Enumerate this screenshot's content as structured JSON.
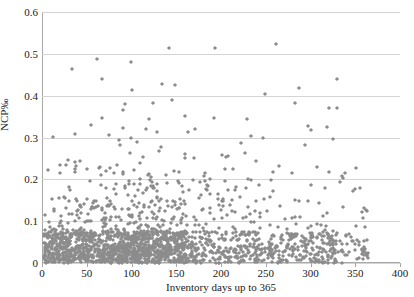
{
  "figure": {
    "cut_off_title": "",
    "background": "#ffffff",
    "marker_color": "#8c8c8c",
    "gridline_color": "#d4d4d4",
    "axis_color": "#a8a8a8"
  },
  "chart_data": {
    "type": "scatter",
    "title": "",
    "xlabel": "Inventory days up to 365",
    "ylabel": "NCP‰",
    "xlim": [
      0,
      400
    ],
    "ylim": [
      0,
      0.6
    ],
    "xticks": [
      0,
      50,
      100,
      150,
      200,
      250,
      300,
      350,
      400
    ],
    "xtick_labels": [
      "0",
      "50",
      "100",
      "150",
      "200",
      "250",
      "300",
      "350",
      "400"
    ],
    "yticks": [
      0,
      0.1,
      0.2,
      0.3,
      0.4,
      0.5,
      0.6
    ],
    "ytick_labels": [
      "0",
      "0.1",
      "0.2",
      "0.3",
      "0.4",
      "0.5",
      "0.6"
    ],
    "grid": "horizontal",
    "legend": "none",
    "marker": "diamond",
    "series_name": "observations",
    "n_points": 1600,
    "notable_points": [
      {
        "x": 193,
        "y": 0.515
      },
      {
        "x": 99,
        "y": 0.481
      },
      {
        "x": 33,
        "y": 0.463
      },
      {
        "x": 330,
        "y": 0.441
      },
      {
        "x": 134,
        "y": 0.429
      },
      {
        "x": 287,
        "y": 0.419
      },
      {
        "x": 330,
        "y": 0.37
      },
      {
        "x": 93,
        "y": 0.38
      },
      {
        "x": 91,
        "y": 0.366
      },
      {
        "x": 119,
        "y": 0.345
      },
      {
        "x": 55,
        "y": 0.331
      },
      {
        "x": 129,
        "y": 0.314
      },
      {
        "x": 300,
        "y": 0.318
      },
      {
        "x": 297,
        "y": 0.328
      },
      {
        "x": 233,
        "y": 0.303
      },
      {
        "x": 247,
        "y": 0.3
      },
      {
        "x": 86,
        "y": 0.294
      },
      {
        "x": 99,
        "y": 0.298
      },
      {
        "x": 222,
        "y": 0.288
      }
    ]
  }
}
